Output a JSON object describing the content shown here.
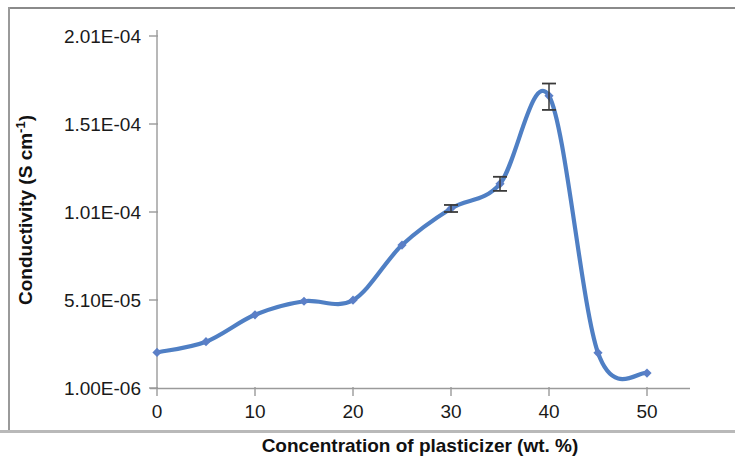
{
  "figure": {
    "background_color": "#ffffff",
    "series_color": "#4f7fc4",
    "marker_color": "#5b7fc7",
    "error_bar_color": "#3a3a3a",
    "axis_color": "#9a9a9a",
    "text_color": "#1a1a1a"
  },
  "chart_data": {
    "type": "line",
    "title": "",
    "subtitle": "",
    "xlabel": "Concentration of plasticizer (wt. %)",
    "ylabel": "Conductivity (S cm⁻¹)",
    "ylabel_main": "Conductivity (S cm",
    "ylabel_sup": "-1",
    "ylabel_tail": ")",
    "x": [
      0,
      5,
      10,
      15,
      20,
      25,
      30,
      35,
      40,
      45,
      50
    ],
    "values": [
      2.12e-05,
      2.73e-05,
      4.26e-05,
      5.03e-05,
      5.09e-05,
      8.22e-05,
      0.000103,
      0.000117,
      0.000167,
      2.1e-05,
      9.5e-06
    ],
    "series": [
      {
        "name": "Conductivity",
        "x": [
          0,
          5,
          10,
          15,
          20,
          25,
          30,
          35,
          40,
          45,
          50
        ],
        "values": [
          2.12e-05,
          2.73e-05,
          4.26e-05,
          5.03e-05,
          5.09e-05,
          8.22e-05,
          0.000103,
          0.000117,
          0.000167,
          2.1e-05,
          9.5e-06
        ],
        "error_bars": [
          {
            "x": 30,
            "lower": 2e-06,
            "upper": 2e-06
          },
          {
            "x": 35,
            "lower": 4e-06,
            "upper": 4e-06
          },
          {
            "x": 40,
            "lower": 8e-06,
            "upper": 7e-06
          }
        ],
        "smoothed": true,
        "marker": "diamond"
      }
    ],
    "xlim": [
      0,
      50
    ],
    "ylim": [
      1e-06,
      0.000201
    ],
    "xticks": [
      0,
      10,
      20,
      30,
      40,
      50
    ],
    "xtick_labels": [
      "0",
      "10",
      "20",
      "30",
      "40",
      "50"
    ],
    "yticks": [
      1e-06,
      5.1e-05,
      0.000101,
      0.000151,
      0.000201
    ],
    "ytick_labels": [
      "1.00E-06",
      "5.10E-05",
      "1.01E-04",
      "1.51E-04",
      "2.01E-04"
    ],
    "grid": false,
    "legend": null,
    "legend_position": "none",
    "annotations": []
  }
}
